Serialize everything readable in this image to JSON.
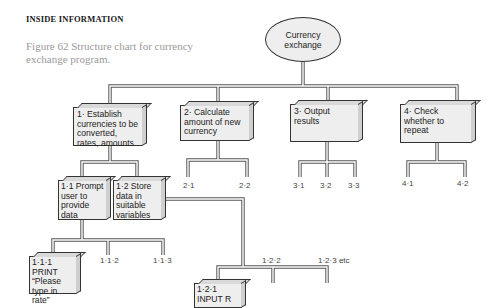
{
  "page": {
    "header": "INSIDE INFORMATION",
    "caption": "Figure 62  Structure chart for currency exchange program."
  },
  "diagram": {
    "root": {
      "label": "Currency exchange"
    },
    "level1": [
      {
        "id": "1",
        "label": "1· Establish currencies to be converted, rates, amounts"
      },
      {
        "id": "2",
        "label": "2· Calculate amount of new currency"
      },
      {
        "id": "3",
        "label": "3· Output results"
      },
      {
        "id": "4",
        "label": "4· Check whether to repeat"
      }
    ],
    "level2": [
      {
        "id": "1.1",
        "label": "1·1 Prompt user to provide data"
      },
      {
        "id": "1.2",
        "label": "1·2 Store data in suitable variables"
      }
    ],
    "level3": [
      {
        "id": "1.1.1",
        "label": "1·1·1 PRINT “Please type in rate”"
      },
      {
        "id": "1.2.1",
        "label": "1·2·1 INPUT R"
      }
    ],
    "leaves": {
      "l2_1": "2·1",
      "l2_2": "2·2",
      "l3_1": "3·1",
      "l3_2": "3·2",
      "l3_3": "3·3",
      "l4_1": "4·1",
      "l4_2": "4·2",
      "l1_1_2": "1·1·2",
      "l1_1_3": "1·1·3",
      "l1_2_2": "1·2·2",
      "l1_2_3": "1·2·3 etc"
    }
  }
}
